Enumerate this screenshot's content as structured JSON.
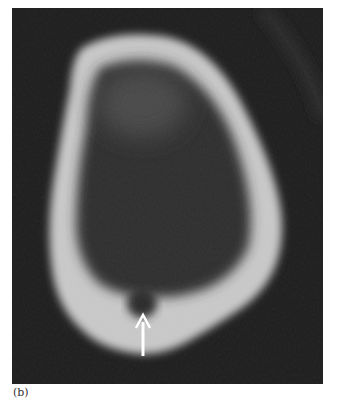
{
  "figure": {
    "panel_label": "(b)",
    "image_description": "Grayscale CT cross-section of a bone showing a rounded-triangular cortical ring with a small dark circular defect at the bottom, indicated by a white arrow",
    "annotation": {
      "type": "arrow",
      "direction": "up",
      "color": "#ffffff"
    },
    "colors": {
      "background": "#1c1c1c",
      "bone": "#cfcfcf",
      "marrow": "#2e2e2e",
      "page": "#ffffff"
    }
  }
}
